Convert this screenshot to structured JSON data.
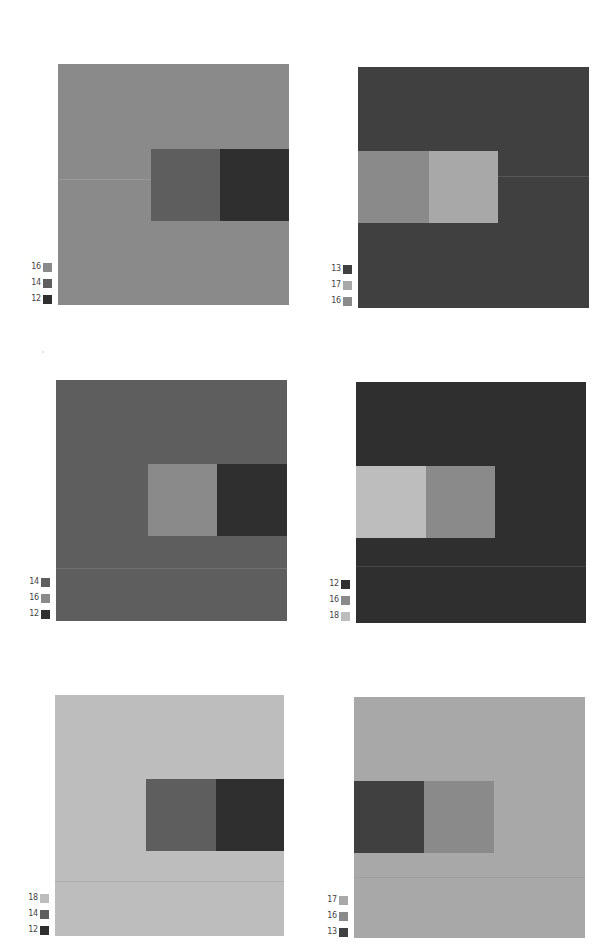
{
  "figure": {
    "levels": {
      "12": "#2f2f2f",
      "13": "#404040",
      "14": "#5e5e5e",
      "16": "#8a8a8a",
      "17": "#a8a8a8",
      "18": "#bdbdbd"
    },
    "panels": [
      {
        "id": "panel-1",
        "background": {
          "level": "16",
          "color": "#8a8a8a"
        },
        "left_square": {
          "level": "14",
          "color": "#5e5e5e"
        },
        "right_square": {
          "level": "12",
          "color": "#2f2f2f"
        },
        "legend": [
          {
            "label": "16",
            "color": "#8a8a8a"
          },
          {
            "label": "14",
            "color": "#5e5e5e"
          },
          {
            "label": "12",
            "color": "#2f2f2f"
          }
        ]
      },
      {
        "id": "panel-2",
        "background": {
          "level": "13",
          "color": "#404040"
        },
        "left_square": {
          "level": "16",
          "color": "#8a8a8a"
        },
        "right_square": {
          "level": "17",
          "color": "#a8a8a8"
        },
        "legend": [
          {
            "label": "13",
            "color": "#404040"
          },
          {
            "label": "17",
            "color": "#a8a8a8"
          },
          {
            "label": "16",
            "color": "#8a8a8a"
          }
        ]
      },
      {
        "id": "panel-3",
        "background": {
          "level": "14",
          "color": "#5e5e5e"
        },
        "left_square": {
          "level": "16",
          "color": "#8a8a8a"
        },
        "right_square": {
          "level": "12",
          "color": "#2f2f2f"
        },
        "legend": [
          {
            "label": "14",
            "color": "#5e5e5e"
          },
          {
            "label": "16",
            "color": "#8a8a8a"
          },
          {
            "label": "12",
            "color": "#2f2f2f"
          }
        ]
      },
      {
        "id": "panel-4",
        "background": {
          "level": "12",
          "color": "#2f2f2f"
        },
        "left_square": {
          "level": "18",
          "color": "#bdbdbd"
        },
        "right_square": {
          "level": "16",
          "color": "#8a8a8a"
        },
        "legend": [
          {
            "label": "12",
            "color": "#2f2f2f"
          },
          {
            "label": "16",
            "color": "#8a8a8a"
          },
          {
            "label": "18",
            "color": "#bdbdbd"
          }
        ]
      },
      {
        "id": "panel-5",
        "background": {
          "level": "18",
          "color": "#bdbdbd"
        },
        "left_square": {
          "level": "14",
          "color": "#5e5e5e"
        },
        "right_square": {
          "level": "12",
          "color": "#2f2f2f"
        },
        "legend": [
          {
            "label": "18",
            "color": "#bdbdbd"
          },
          {
            "label": "14",
            "color": "#5e5e5e"
          },
          {
            "label": "12",
            "color": "#2f2f2f"
          }
        ]
      },
      {
        "id": "panel-6",
        "background": {
          "level": "17",
          "color": "#a8a8a8"
        },
        "left_square": {
          "level": "13",
          "color": "#404040"
        },
        "right_square": {
          "level": "16",
          "color": "#8a8a8a"
        },
        "legend": [
          {
            "label": "17",
            "color": "#a8a8a8"
          },
          {
            "label": "16",
            "color": "#8a8a8a"
          },
          {
            "label": "13",
            "color": "#404040"
          }
        ]
      }
    ]
  }
}
